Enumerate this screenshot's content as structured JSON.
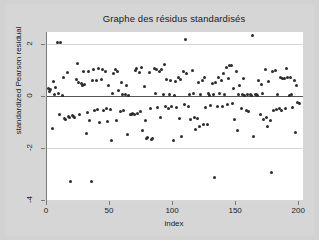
{
  "chart_data": {
    "type": "scatter",
    "title": "Graphe des résidus standardisés",
    "xlabel": "index",
    "ylabel": "standardized Pearson residual",
    "xlim": [
      0,
      203
    ],
    "ylim": [
      -4,
      2.45
    ],
    "xticks": [
      0,
      50,
      100,
      150,
      200
    ],
    "xtick_labels": [
      "0",
      "50",
      "100",
      "150",
      "200"
    ],
    "yticks": [
      2,
      0,
      -2,
      -4
    ],
    "ytick_labels": [
      "2",
      "0",
      "-2",
      "-4"
    ],
    "grid": "horizontal",
    "gridlines_at": [
      2,
      -2,
      -4
    ],
    "reference_line": 0,
    "legend": "none",
    "marker": "filled-circle",
    "marker_color": "#2b2b2b",
    "panel_color": "#ffffff",
    "page_color": "#d6d6d6",
    "points": [
      [
        1,
        0.3
      ],
      [
        2,
        0.18
      ],
      [
        3,
        0.25
      ],
      [
        4,
        -1.25
      ],
      [
        5,
        0.55
      ],
      [
        6,
        0.05
      ],
      [
        7,
        0.32
      ],
      [
        8,
        2.05
      ],
      [
        9,
        0.1
      ],
      [
        10,
        -0.7
      ],
      [
        11,
        2.05
      ],
      [
        12,
        0.02
      ],
      [
        13,
        0.72
      ],
      [
        14,
        -0.88
      ],
      [
        15,
        -0.92
      ],
      [
        16,
        0.9
      ],
      [
        17,
        -0.78
      ],
      [
        18,
        -0.82
      ],
      [
        19,
        -3.3
      ],
      [
        20,
        -0.75
      ],
      [
        21,
        -0.8
      ],
      [
        22,
        -0.85
      ],
      [
        23,
        0.62
      ],
      [
        24,
        1.25
      ],
      [
        25,
        0.5
      ],
      [
        26,
        -0.7
      ],
      [
        27,
        0.48
      ],
      [
        28,
        0.38
      ],
      [
        29,
        0.95
      ],
      [
        30,
        0.42
      ],
      [
        31,
        -1.45
      ],
      [
        32,
        -0.65
      ],
      [
        33,
        0.95
      ],
      [
        34,
        -0.95
      ],
      [
        35,
        -3.28
      ],
      [
        36,
        0.6
      ],
      [
        37,
        1.0
      ],
      [
        38,
        -0.55
      ],
      [
        39,
        0.58
      ],
      [
        40,
        -0.52
      ],
      [
        41,
        1.05
      ],
      [
        42,
        -1.02
      ],
      [
        43,
        0.62
      ],
      [
        44,
        1.02
      ],
      [
        45,
        -0.55
      ],
      [
        46,
        0.92
      ],
      [
        47,
        -0.48
      ],
      [
        48,
        -1.0
      ],
      [
        49,
        0.4
      ],
      [
        50,
        -0.52
      ],
      [
        51,
        -1.72
      ],
      [
        52,
        0.08
      ],
      [
        53,
        0.85
      ],
      [
        54,
        1.0
      ],
      [
        55,
        -0.95
      ],
      [
        56,
        0.95
      ],
      [
        57,
        0.2
      ],
      [
        58,
        -0.6
      ],
      [
        59,
        0.52
      ],
      [
        60,
        0.05
      ],
      [
        61,
        -0.58
      ],
      [
        62,
        0.05
      ],
      [
        63,
        0.38
      ],
      [
        64,
        -1.48
      ],
      [
        65,
        0.02
      ],
      [
        66,
        -0.7
      ],
      [
        67,
        -0.72
      ],
      [
        68,
        -0.68
      ],
      [
        69,
        -0.7
      ],
      [
        70,
        0.98
      ],
      [
        71,
        1.05
      ],
      [
        72,
        -0.66
      ],
      [
        73,
        0.9
      ],
      [
        74,
        -0.62
      ],
      [
        75,
        1.08
      ],
      [
        76,
        -1.35
      ],
      [
        77,
        0.35
      ],
      [
        78,
        -0.95
      ],
      [
        79,
        -1.62
      ],
      [
        80,
        -1.6
      ],
      [
        81,
        0.88
      ],
      [
        82,
        -0.48
      ],
      [
        83,
        -1.68
      ],
      [
        84,
        -1.65
      ],
      [
        85,
        1.05
      ],
      [
        86,
        0.1
      ],
      [
        87,
        1.02
      ],
      [
        88,
        -0.45
      ],
      [
        89,
        0.95
      ],
      [
        90,
        -0.82
      ],
      [
        91,
        1.0
      ],
      [
        92,
        0.05
      ],
      [
        93,
        1.2
      ],
      [
        94,
        -0.4
      ],
      [
        95,
        0.62
      ],
      [
        96,
        -0.5
      ],
      [
        97,
        0.05
      ],
      [
        98,
        0.58
      ],
      [
        99,
        -0.42
      ],
      [
        100,
        -1.72
      ],
      [
        101,
        0.02
      ],
      [
        102,
        0.55
      ],
      [
        103,
        -0.45
      ],
      [
        104,
        0.72
      ],
      [
        105,
        -0.88
      ],
      [
        106,
        0.62
      ],
      [
        107,
        -1.58
      ],
      [
        108,
        0.95
      ],
      [
        109,
        -0.35
      ],
      [
        110,
        2.15
      ],
      [
        111,
        0.85
      ],
      [
        112,
        -0.4
      ],
      [
        113,
        0.05
      ],
      [
        114,
        -0.9
      ],
      [
        115,
        0.98
      ],
      [
        116,
        0.08
      ],
      [
        117,
        -0.85
      ],
      [
        118,
        -1.28
      ],
      [
        119,
        -0.88
      ],
      [
        120,
        0.5
      ],
      [
        121,
        -1.18
      ],
      [
        122,
        0.05
      ],
      [
        123,
        0.6
      ],
      [
        124,
        -1.1
      ],
      [
        125,
        0.7
      ],
      [
        126,
        -0.45
      ],
      [
        127,
        -1.12
      ],
      [
        128,
        0.08
      ],
      [
        129,
        0.02
      ],
      [
        130,
        -0.38
      ],
      [
        131,
        0.48
      ],
      [
        132,
        0.05
      ],
      [
        133,
        -3.12
      ],
      [
        134,
        0.52
      ],
      [
        135,
        -0.42
      ],
      [
        136,
        0.72
      ],
      [
        137,
        0.1
      ],
      [
        138,
        0.58
      ],
      [
        139,
        -0.4
      ],
      [
        140,
        0.85
      ],
      [
        141,
        0.05
      ],
      [
        142,
        1.08
      ],
      [
        143,
        -0.35
      ],
      [
        144,
        0.65
      ],
      [
        145,
        1.18
      ],
      [
        146,
        1.15
      ],
      [
        147,
        -0.3
      ],
      [
        148,
        0.3
      ],
      [
        149,
        -0.9
      ],
      [
        150,
        0.92
      ],
      [
        151,
        -1.32
      ],
      [
        152,
        0.05
      ],
      [
        153,
        0.4
      ],
      [
        154,
        -0.48
      ],
      [
        155,
        0.05
      ],
      [
        156,
        0.68
      ],
      [
        157,
        0.02
      ],
      [
        158,
        -0.58
      ],
      [
        159,
        0.04
      ],
      [
        160,
        -0.62
      ],
      [
        161,
        0.04
      ],
      [
        162,
        0.02
      ],
      [
        163,
        2.3
      ],
      [
        164,
        -1.58
      ],
      [
        165,
        0.05
      ],
      [
        166,
        0.05
      ],
      [
        167,
        0.02
      ],
      [
        168,
        0.6
      ],
      [
        169,
        -0.7
      ],
      [
        170,
        0.45
      ],
      [
        171,
        0.08
      ],
      [
        172,
        -0.92
      ],
      [
        173,
        1.0
      ],
      [
        174,
        -0.85
      ],
      [
        175,
        -1.18
      ],
      [
        176,
        0.55
      ],
      [
        177,
        -0.95
      ],
      [
        178,
        -2.95
      ],
      [
        179,
        0.92
      ],
      [
        180,
        -0.55
      ],
      [
        181,
        0.96
      ],
      [
        182,
        -0.52
      ],
      [
        183,
        0.06
      ],
      [
        184,
        -0.5
      ],
      [
        185,
        0.72
      ],
      [
        186,
        -0.55
      ],
      [
        187,
        0.68
      ],
      [
        188,
        0.65
      ],
      [
        189,
        -0.48
      ],
      [
        190,
        1.05
      ],
      [
        191,
        0.7
      ],
      [
        192,
        0.02
      ],
      [
        193,
        0.72
      ],
      [
        194,
        0.05
      ],
      [
        195,
        -0.45
      ],
      [
        196,
        0.58
      ],
      [
        197,
        -1.4
      ],
      [
        198,
        0.4
      ],
      [
        199,
        -0.25
      ],
      [
        200,
        -0.3
      ]
    ]
  }
}
